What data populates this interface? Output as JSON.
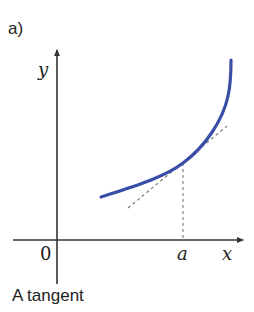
{
  "figure": {
    "panel_label": "a)",
    "caption": "A tangent",
    "axes": {
      "x_label": "x",
      "y_label": "y",
      "origin_label": "0",
      "point_label": "a"
    },
    "colors": {
      "curve": "#3a4ea8",
      "axes": "#333333",
      "dashed": "#777777",
      "text": "#222222"
    }
  }
}
